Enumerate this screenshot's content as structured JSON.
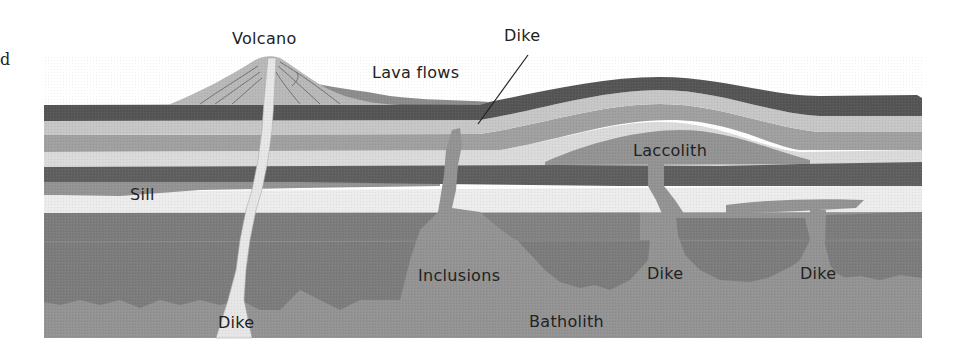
{
  "diagram": {
    "margin_text": "d",
    "labels": {
      "volcano": "Volcano",
      "lava_flows": "Lava flows",
      "dike_top": "Dike",
      "laccolith": "Laccolith",
      "sill": "Sill",
      "inclusions": "Inclusions",
      "dike_bottom_left": "Dike",
      "dike_middle": "Dike",
      "dike_right": "Dike",
      "batholith": "Batholith"
    },
    "colors": {
      "background": "#ffffff",
      "dark_layer": "#5a5a5a",
      "light_layer": "#c8c8c8",
      "mid_layer": "#9a9a9a",
      "pale_layer": "#dcdcdc",
      "sill_white": "#ececec",
      "deep_rock": "#7c7c7c",
      "batholith": "#939393",
      "volcano_cone": "#b4b4b4",
      "magma_conduit": "#e4e4e4",
      "label_text": "#222222"
    }
  }
}
